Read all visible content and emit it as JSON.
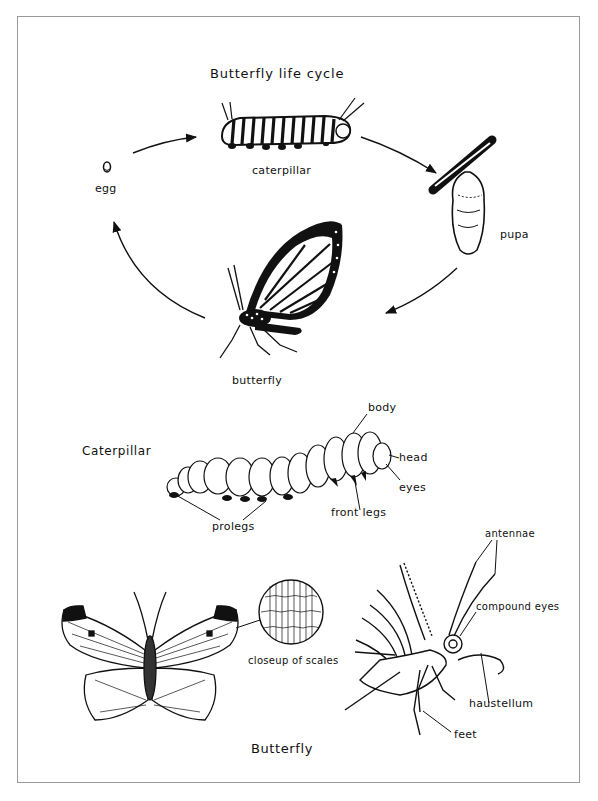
{
  "life_cycle": {
    "title": "Butterfly life cycle",
    "stages": [
      {
        "id": "egg",
        "label": "egg"
      },
      {
        "id": "caterpillar",
        "label": "caterpillar"
      },
      {
        "id": "pupa",
        "label": "pupa"
      },
      {
        "id": "butterfly",
        "label": "butterfly"
      }
    ],
    "arrows": [
      {
        "from": "egg",
        "to": "caterpillar"
      },
      {
        "from": "caterpillar",
        "to": "pupa"
      },
      {
        "from": "pupa",
        "to": "butterfly"
      },
      {
        "from": "butterfly",
        "to": "egg"
      }
    ]
  },
  "caterpillar_anatomy": {
    "section_title": "Caterpillar",
    "labels": {
      "body": "body",
      "head": "head",
      "eyes": "eyes",
      "front_legs": "front legs",
      "prolegs": "prolegs"
    }
  },
  "butterfly_anatomy": {
    "section_title": "Butterfly",
    "labels": {
      "closeup": "closeup of scales",
      "antennae": "antennae",
      "compound_eyes": "compound eyes",
      "haustellum": "haustellum",
      "feet": "feet"
    }
  },
  "colors": {
    "ink": "#111111",
    "background": "#ffffff",
    "frame": "#9a9a9a"
  }
}
